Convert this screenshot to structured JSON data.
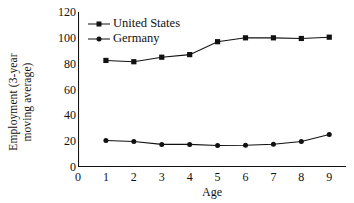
{
  "chart_data": {
    "type": "line",
    "title": "",
    "subtitle": "",
    "xlabel": "Age",
    "ylabel": "Employment (3-year moving average)",
    "ylabel_line1": "Employment (3-year",
    "ylabel_line2": "moving average)",
    "x": [
      1,
      2,
      3,
      4,
      5,
      6,
      7,
      8,
      9
    ],
    "xlim": [
      0,
      9.6
    ],
    "ylim": [
      0,
      120
    ],
    "xticks": [
      0,
      1,
      2,
      3,
      4,
      5,
      6,
      7,
      8,
      9
    ],
    "yticks": [
      0,
      20,
      40,
      60,
      80,
      100,
      120
    ],
    "xticklabels": [
      "0",
      "1",
      "2",
      "3",
      "4",
      "5",
      "6",
      "7",
      "8",
      "9"
    ],
    "yticklabels": [
      "0",
      "20",
      "40",
      "60",
      "80",
      "100",
      "120"
    ],
    "grid": false,
    "legend_position": "upper left",
    "series": [
      {
        "name": "United States",
        "marker": "square",
        "color": "#111111",
        "values": [
          82.5,
          81.5,
          85.0,
          87.0,
          97.0,
          100.0,
          100.0,
          99.5,
          100.5
        ]
      },
      {
        "name": "Germany",
        "marker": "circle",
        "color": "#111111",
        "values": [
          20.5,
          19.8,
          17.5,
          17.5,
          16.7,
          16.8,
          17.6,
          19.8,
          25.2
        ]
      }
    ]
  },
  "legend": {
    "items": [
      {
        "label": "United States",
        "marker": "square"
      },
      {
        "label": "Germany",
        "marker": "circle"
      }
    ]
  },
  "axes": {
    "x_title": "Age",
    "y_title_line1": "Employment (3-year",
    "y_title_line2": "moving average)"
  },
  "colors": {
    "ink": "#111111",
    "background": "#ffffff",
    "line": "#111111"
  }
}
